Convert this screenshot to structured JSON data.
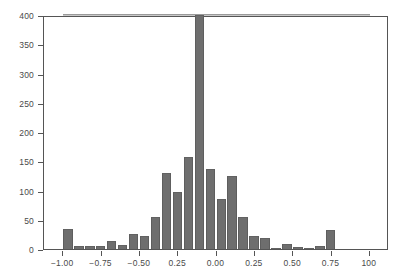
{
  "chart_data": {
    "type": "bar",
    "title": "",
    "subtitle": "",
    "xlabel": "",
    "ylabel": "",
    "xlim": [
      -1.125,
      1.125
    ],
    "ylim": [
      0,
      400
    ],
    "grid": false,
    "legend": null,
    "bar_color": "#6e6e6e",
    "frame_color": "#555555",
    "reference_line": {
      "orientation": "horizontal",
      "value": 400,
      "color": "#9a9a9a",
      "x_start": -1.0,
      "x_end": 1.0
    },
    "x_tick_labels": [
      "−1.00",
      "−0.75",
      "−0.50",
      "0.25",
      "0.00",
      "0.25",
      "0.50",
      "0.75",
      "100"
    ],
    "x_tick_values": [
      -1.0,
      -0.75,
      -0.5,
      -0.25,
      0.0,
      0.25,
      0.5,
      0.75,
      1.0
    ],
    "y_tick_labels": [
      "0",
      "50",
      "100",
      "150",
      "200",
      "250",
      "300",
      "350",
      "400"
    ],
    "y_tick_values": [
      0,
      50,
      100,
      150,
      200,
      250,
      300,
      350,
      400
    ],
    "bin_width": 0.0714,
    "x": [
      -0.964,
      -0.893,
      -0.821,
      -0.75,
      -0.679,
      -0.607,
      -0.536,
      -0.464,
      -0.393,
      -0.321,
      -0.25,
      -0.179,
      -0.107,
      -0.036,
      0.036,
      0.107,
      0.179,
      0.25,
      0.321,
      0.393,
      0.464,
      0.536,
      0.607,
      0.679,
      0.75,
      0.821,
      0.893,
      0.964
    ],
    "values": [
      35,
      5,
      5,
      5,
      13,
      7,
      25,
      23,
      54,
      130,
      98,
      158,
      400,
      136,
      86,
      125,
      54,
      23,
      19,
      2,
      9,
      3,
      2,
      5,
      32,
      0,
      0,
      0
    ],
    "categories": [
      "-0.964",
      "-0.893",
      "-0.821",
      "-0.750",
      "-0.679",
      "-0.607",
      "-0.536",
      "-0.464",
      "-0.393",
      "-0.321",
      "-0.250",
      "-0.179",
      "-0.107",
      "-0.036",
      "0.036",
      "0.107",
      "0.179",
      "0.250",
      "0.321",
      "0.393",
      "0.464",
      "0.536",
      "0.607",
      "0.679",
      "0.750",
      "0.821",
      "0.893",
      "0.964"
    ]
  }
}
